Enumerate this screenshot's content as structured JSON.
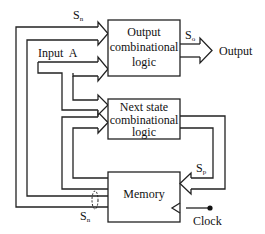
{
  "diagram": {
    "type": "finite-state-machine-block-diagram",
    "blocks": {
      "output_logic": {
        "line1": "Output",
        "line2": "combinational",
        "line3": "logic"
      },
      "next_state_logic": {
        "line1": "Next state",
        "line2": "combinational",
        "line3": "logic"
      },
      "memory": {
        "label": "Memory"
      }
    },
    "signals": {
      "sn_top": "S",
      "sn_top_sub": "n",
      "so": "S",
      "so_sub": "o",
      "output": "Output",
      "input_a": "Input  A",
      "sp": "S",
      "sp_sub": "p",
      "sn_bottom": "S",
      "sn_bottom_sub": "n",
      "clock": "Clock"
    },
    "edges": [
      {
        "from": "memory",
        "to": "output_logic",
        "label": "Sn"
      },
      {
        "from": "memory",
        "to": "next_state_logic",
        "label": "Sn"
      },
      {
        "from": "input_a",
        "to": "output_logic"
      },
      {
        "from": "input_a",
        "to": "next_state_logic"
      },
      {
        "from": "output_logic",
        "to": "output",
        "label": "So"
      },
      {
        "from": "next_state_logic",
        "to": "memory",
        "label": "Sp"
      },
      {
        "from": "clock",
        "to": "memory"
      }
    ]
  }
}
